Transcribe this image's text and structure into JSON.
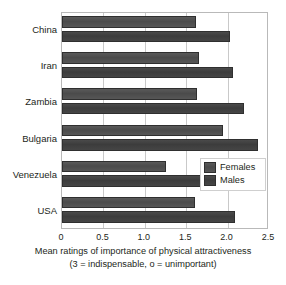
{
  "chart_data": {
    "type": "bar",
    "orientation": "horizontal",
    "title": "",
    "xlabel": "Mean ratings of importance of physical attractiveness",
    "xlabel_line2": "(3 = indispensable, o = unimportant)",
    "ylabel": "",
    "categories": [
      "China",
      "Iran",
      "Zambia",
      "Bulgaria",
      "Venezuela",
      "USA"
    ],
    "series": [
      {
        "name": "Females",
        "values": [
          1.62,
          1.65,
          1.63,
          1.95,
          1.26,
          1.61
        ],
        "color": "#4e4e4e"
      },
      {
        "name": "Males",
        "values": [
          2.03,
          2.06,
          2.2,
          2.37,
          1.78,
          2.09
        ],
        "color": "#3f3f3f"
      }
    ],
    "xlim": [
      0,
      2.5
    ],
    "xticks": [
      "0",
      "0.5",
      "1.0",
      "1.5",
      "2.0",
      "2.5"
    ],
    "xtick_values": [
      0,
      0.5,
      1.0,
      1.5,
      2.0,
      2.5
    ],
    "grid": true,
    "grid_axis": "x",
    "legend_position": "middle-right"
  },
  "legend": {
    "items": [
      {
        "label": "Females"
      },
      {
        "label": "Males"
      }
    ]
  }
}
